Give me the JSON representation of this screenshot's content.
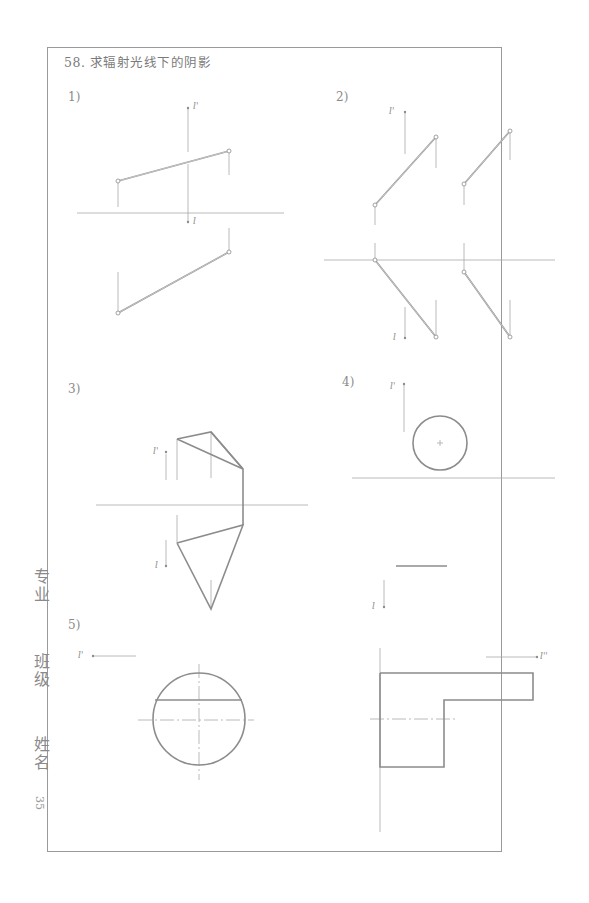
{
  "page": {
    "title": "58. 求辐射光线下的阴影",
    "page_number": "35",
    "side_labels": {
      "major": "专业",
      "class": "班级",
      "name": "姓名"
    }
  },
  "problems": [
    {
      "label": "1)",
      "light_top": "l'",
      "light_bottom": "l"
    },
    {
      "label": "2)",
      "light_top": "l'",
      "light_bottom": "l"
    },
    {
      "label": "3)",
      "light_top": "l'",
      "light_bottom": "l"
    },
    {
      "label": "4)",
      "light_top": "l'",
      "light_bottom": "l"
    },
    {
      "label": "5)",
      "light_left": "l'",
      "light_right": "l''",
      "light_top": "l"
    }
  ],
  "colors": {
    "line": "#8c8c8c",
    "thin_line": "#a8a8a8",
    "frame": "#9a9a9a",
    "text": "#7a7a7a"
  }
}
